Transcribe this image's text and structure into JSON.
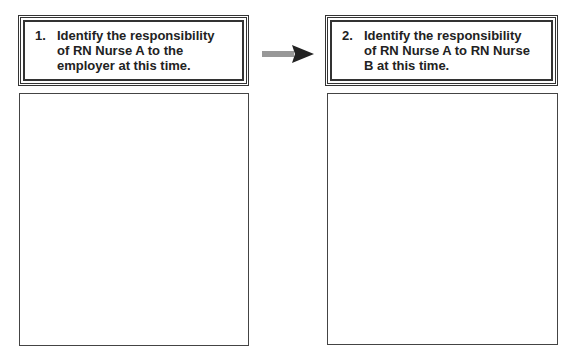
{
  "steps": [
    {
      "number": "1.",
      "text_lines": [
        "Identify the responsibility",
        "of RN Nurse A to the",
        "employer at this time."
      ]
    },
    {
      "number": "2.",
      "text_lines": [
        "Identify the responsibility",
        "of RN Nurse A to RN Nurse",
        "B at this time."
      ]
    }
  ],
  "connector": {
    "icon": "right-arrow-icon",
    "color": "#222222"
  },
  "answer_boxes": [
    {
      "content": ""
    },
    {
      "content": ""
    }
  ]
}
